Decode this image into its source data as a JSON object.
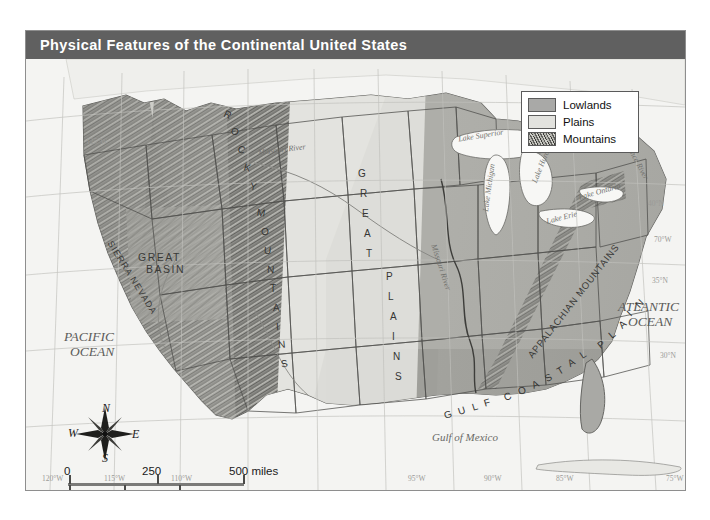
{
  "title": "Physical Features of the Continental United States",
  "legend": {
    "items": [
      {
        "label": "Lowlands",
        "swatch": "lowlands",
        "color": "#a9a9a7"
      },
      {
        "label": "Plains",
        "swatch": "plains",
        "color": "#e2e2de"
      },
      {
        "label": "Mountains",
        "swatch": "mountains",
        "color": "#5f5f5c"
      }
    ]
  },
  "compass": {
    "north": "N",
    "east": "E",
    "south": "S",
    "west": "W"
  },
  "scale": {
    "miles": {
      "unit": "miles",
      "ticks": [
        "0",
        "250",
        "500"
      ]
    },
    "kilometers": {
      "unit": "kilometers",
      "ticks": [
        "0",
        "250",
        "500"
      ]
    },
    "miles_label": "500 miles",
    "km_label": "500 kilometers"
  },
  "oceans": [
    {
      "name": "pacific-ocean",
      "line1": "PACIFIC",
      "line2": "OCEAN"
    },
    {
      "name": "atlantic-ocean",
      "line1": "ATLANTIC",
      "line2": "OCEAN"
    }
  ],
  "water_features": [
    {
      "name": "gulf-of-mexico",
      "label": "Gulf of Mexico"
    },
    {
      "name": "lake-superior",
      "label": "Lake Superior"
    },
    {
      "name": "lake-michigan",
      "label": "Lake Michigan"
    },
    {
      "name": "lake-huron",
      "label": "Lake Huron"
    },
    {
      "name": "lake-erie",
      "label": "Lake Erie"
    },
    {
      "name": "lake-ontario",
      "label": "Lake Ontario"
    },
    {
      "name": "missouri-river",
      "label": "Missouri River"
    },
    {
      "name": "missouri-river-2",
      "label": "Missouri River"
    },
    {
      "name": "st-lawrence-river",
      "label": "St. Lawrence River"
    }
  ],
  "physical_regions": [
    {
      "name": "rocky-mountains",
      "label": "ROCKY MOUNTAINS"
    },
    {
      "name": "great-plains",
      "label": "GREAT PLAINS"
    },
    {
      "name": "sierra-nevada",
      "label": "SIERRA NEVADA"
    },
    {
      "name": "great-basin",
      "line1": "GREAT",
      "line2": "BASIN"
    },
    {
      "name": "appalachian-mountains",
      "label": "APPALACHIAN MOUNTAINS"
    },
    {
      "name": "gulf-coastal-plain",
      "label": "GULF COASTAL PLAIN"
    }
  ],
  "graticule": {
    "longitudes": [
      "125°W",
      "120°W",
      "115°W",
      "110°W",
      "95°W",
      "90°W",
      "85°W",
      "80°W",
      "75°W"
    ],
    "latitudes": [
      "45°N",
      "40°N",
      "35°N",
      "30°N"
    ],
    "right_labels": [
      "40°N",
      "70°W",
      "35°N",
      "30°N"
    ],
    "bottom_labels": [
      "120°W",
      "115°W",
      "110°W",
      "95°W",
      "90°W",
      "85°W",
      "75°W"
    ],
    "left_labels": [
      "125°W"
    ]
  },
  "colors": {
    "title_bar": "#606060",
    "title_text": "#ffffff",
    "frame_border": "#8e8e8e",
    "ocean_bg": "#f4f4f2",
    "lowlands": "#a9a9a7",
    "plains": "#e2e2de",
    "mountains": "#6f6f6b"
  }
}
